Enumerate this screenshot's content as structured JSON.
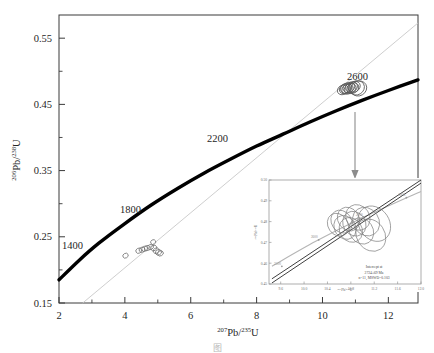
{
  "figure": {
    "type": "concordia-diagram",
    "caption_partial": "图"
  },
  "axes": {
    "x_title_pre": "207",
    "x_title_mid": "Pb/",
    "x_title_sup2": "235",
    "x_title_post": "U",
    "y_title_pre": "206",
    "y_title_mid": "Pb/",
    "y_title_sup2": "238",
    "y_title_post": "U",
    "x_ticks": [
      "2",
      "4",
      "6",
      "8",
      "10",
      "12"
    ],
    "y_ticks": [
      "0.15",
      "0.25",
      "0.35",
      "0.45",
      "0.55"
    ]
  },
  "age_labels": [
    {
      "text": "1400"
    },
    {
      "text": "1800"
    },
    {
      "text": "2200"
    },
    {
      "text": "2600"
    }
  ],
  "inset": {
    "x_ticks": [
      "9.6",
      "10.0",
      "10.4",
      "10.8",
      "11.2",
      "11.6",
      "12.0"
    ],
    "y_ticks": [
      "0.45",
      "0.46",
      "0.47",
      "0.48",
      "0.49",
      "0.50"
    ],
    "x_title_pre": "207",
    "x_title_mid": "Pb/",
    "x_title_sup2": "235",
    "x_title_post": "U",
    "y_title_pre": "206",
    "y_title_mid": "Pb/",
    "y_title_sup2": "238",
    "y_title_post": "U",
    "age_marks": [
      "2500",
      "2600",
      "2700",
      "2800"
    ],
    "annotation_line1": "Intercept at",
    "annotation_line2": "2724±69 Ma",
    "annotation_line3": "n=11,  MSWD=0.103"
  },
  "colors": {
    "concordia_curve": "#000000",
    "discordia_line": "#c8c8c8",
    "ellipse_stroke": "#707070",
    "frame": "#3a3a3a",
    "inset_frame": "#9a9a9a",
    "arrow": "#8c8c8c"
  },
  "chart_data": {
    "type": "scatter",
    "title": "",
    "xlabel": "207Pb/235U",
    "ylabel": "206Pb/238U",
    "xlim": [
      2,
      12.9
    ],
    "ylim": [
      0.15,
      0.585
    ],
    "grid": false,
    "legend": "none",
    "concordia_curve_ages_ma": [
      1400,
      1800,
      2200,
      2600
    ],
    "concordia_curve_points": [
      {
        "x": 2.0,
        "y": 0.185
      },
      {
        "x": 2.6,
        "y": 0.214
      },
      {
        "x": 3.2,
        "y": 0.24
      },
      {
        "x": 4.0,
        "y": 0.27
      },
      {
        "x": 4.8,
        "y": 0.298
      },
      {
        "x": 5.6,
        "y": 0.323
      },
      {
        "x": 6.4,
        "y": 0.346
      },
      {
        "x": 7.2,
        "y": 0.367
      },
      {
        "x": 8.0,
        "y": 0.387
      },
      {
        "x": 8.8,
        "y": 0.405
      },
      {
        "x": 9.6,
        "y": 0.423
      },
      {
        "x": 10.4,
        "y": 0.44
      },
      {
        "x": 11.2,
        "y": 0.456
      },
      {
        "x": 12.0,
        "y": 0.471
      },
      {
        "x": 12.9,
        "y": 0.487
      }
    ],
    "discordia_line": {
      "x1": 2.72,
      "y1": 0.15,
      "x2": 12.9,
      "y2": 0.573
    },
    "series": [
      {
        "name": "lower cluster ellipses",
        "points": [
          {
            "x": 4.02,
            "y": 0.2215,
            "rx": 0.085,
            "ry": 0.0035,
            "angle": 28
          },
          {
            "x": 4.42,
            "y": 0.229,
            "rx": 0.09,
            "ry": 0.0038,
            "angle": 28
          },
          {
            "x": 4.52,
            "y": 0.2305,
            "rx": 0.09,
            "ry": 0.0038,
            "angle": 28
          },
          {
            "x": 4.6,
            "y": 0.232,
            "rx": 0.09,
            "ry": 0.0038,
            "angle": 28
          },
          {
            "x": 4.68,
            "y": 0.233,
            "rx": 0.09,
            "ry": 0.0038,
            "angle": 28
          },
          {
            "x": 4.78,
            "y": 0.2345,
            "rx": 0.09,
            "ry": 0.0038,
            "angle": 28
          },
          {
            "x": 4.86,
            "y": 0.242,
            "rx": 0.08,
            "ry": 0.0035,
            "angle": 28
          },
          {
            "x": 4.88,
            "y": 0.233,
            "rx": 0.095,
            "ry": 0.004,
            "angle": 28
          },
          {
            "x": 4.95,
            "y": 0.229,
            "rx": 0.095,
            "ry": 0.004,
            "angle": 28
          },
          {
            "x": 5.02,
            "y": 0.2265,
            "rx": 0.095,
            "ry": 0.004,
            "angle": 28
          },
          {
            "x": 5.08,
            "y": 0.225,
            "rx": 0.09,
            "ry": 0.0038,
            "angle": 28
          }
        ]
      },
      {
        "name": "upper cluster ellipses (2600 Ma)",
        "points": [
          {
            "x": 10.62,
            "y": 0.472,
            "rx": 0.175,
            "ry": 0.007,
            "angle": 30
          },
          {
            "x": 10.68,
            "y": 0.4735,
            "rx": 0.175,
            "ry": 0.007,
            "angle": 30
          },
          {
            "x": 10.72,
            "y": 0.4745,
            "rx": 0.18,
            "ry": 0.0072,
            "angle": 30
          },
          {
            "x": 10.76,
            "y": 0.473,
            "rx": 0.18,
            "ry": 0.0072,
            "angle": 30
          },
          {
            "x": 10.8,
            "y": 0.4755,
            "rx": 0.185,
            "ry": 0.0074,
            "angle": 30
          },
          {
            "x": 10.84,
            "y": 0.474,
            "rx": 0.185,
            "ry": 0.0074,
            "angle": 30
          },
          {
            "x": 10.88,
            "y": 0.476,
            "rx": 0.19,
            "ry": 0.0076,
            "angle": 30
          },
          {
            "x": 10.92,
            "y": 0.4745,
            "rx": 0.19,
            "ry": 0.0076,
            "angle": 30
          },
          {
            "x": 10.96,
            "y": 0.4765,
            "rx": 0.195,
            "ry": 0.0078,
            "angle": 30
          },
          {
            "x": 11.04,
            "y": 0.475,
            "rx": 0.24,
            "ry": 0.0105,
            "angle": 30
          },
          {
            "x": 11.1,
            "y": 0.474,
            "rx": 0.25,
            "ry": 0.011,
            "angle": 30
          }
        ]
      }
    ],
    "inset_chart": {
      "type": "scatter",
      "xlim": [
        9.4,
        12.0
      ],
      "ylim": [
        0.45,
        0.5
      ],
      "xlabel": "207Pb/235U",
      "ylabel": "206Pb/238U",
      "regression_lines": [
        {
          "x1": 9.45,
          "y1": 0.4505,
          "x2": 12.0,
          "y2": 0.4985
        },
        {
          "x1": 9.45,
          "y1": 0.4525,
          "x2": 12.0,
          "y2": 0.5
        }
      ],
      "concordia_segment": [
        {
          "x": 9.45,
          "y": 0.4585
        },
        {
          "x": 10.2,
          "y": 0.4705
        },
        {
          "x": 11.0,
          "y": 0.4818
        },
        {
          "x": 12.0,
          "y": 0.4945
        }
      ],
      "ellipses": [
        {
          "x": 10.58,
          "y": 0.4785,
          "rx": 0.17,
          "ry": 0.0058,
          "angle": 34
        },
        {
          "x": 10.64,
          "y": 0.48,
          "rx": 0.17,
          "ry": 0.0058,
          "angle": 34
        },
        {
          "x": 10.7,
          "y": 0.4772,
          "rx": 0.18,
          "ry": 0.006,
          "angle": 34
        },
        {
          "x": 10.76,
          "y": 0.4812,
          "rx": 0.18,
          "ry": 0.006,
          "angle": 34
        },
        {
          "x": 10.8,
          "y": 0.476,
          "rx": 0.19,
          "ry": 0.0062,
          "angle": 34
        },
        {
          "x": 10.86,
          "y": 0.479,
          "rx": 0.19,
          "ry": 0.0062,
          "angle": 34
        },
        {
          "x": 10.92,
          "y": 0.482,
          "rx": 0.2,
          "ry": 0.0064,
          "angle": 34
        },
        {
          "x": 10.98,
          "y": 0.4755,
          "rx": 0.2,
          "ry": 0.0066,
          "angle": 34
        },
        {
          "x": 11.06,
          "y": 0.48,
          "rx": 0.22,
          "ry": 0.0072,
          "angle": 34
        },
        {
          "x": 11.14,
          "y": 0.4735,
          "rx": 0.24,
          "ry": 0.0082,
          "angle": 34
        },
        {
          "x": 11.2,
          "y": 0.479,
          "rx": 0.26,
          "ry": 0.009,
          "angle": 34
        }
      ]
    }
  }
}
